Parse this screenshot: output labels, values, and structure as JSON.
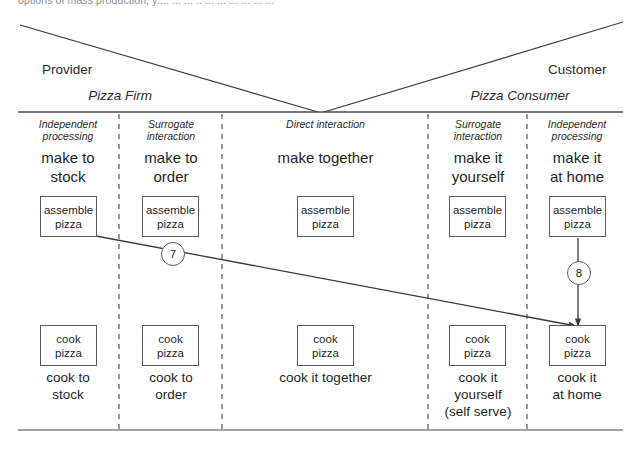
{
  "page": {
    "clipped_caption": "options of mass production, y.... ... ... .. ... ... ... ... ... ..."
  },
  "sides": {
    "provider": "Provider",
    "customer": "Customer"
  },
  "parties": {
    "left": "Pizza Firm",
    "right": "Pizza Consumer"
  },
  "columns": [
    {
      "mode_line1": "Independent",
      "mode_line2": "processing",
      "title_line1": "make to",
      "title_line2": "stock",
      "top_box_line1": "assemble",
      "top_box_line2": "pizza",
      "bottom_box_line1": "cook",
      "bottom_box_line2": "pizza",
      "bottom_label_line1": "cook to",
      "bottom_label_line2": "stock",
      "bottom_label_line3": ""
    },
    {
      "mode_line1": "Surrogate",
      "mode_line2": "interaction",
      "title_line1": "make to",
      "title_line2": "order",
      "top_box_line1": "assemble",
      "top_box_line2": "pizza",
      "bottom_box_line1": "cook",
      "bottom_box_line2": "pizza",
      "bottom_label_line1": "cook to",
      "bottom_label_line2": "order",
      "bottom_label_line3": ""
    },
    {
      "mode_line1": "Direct interaction",
      "mode_line2": "",
      "title_line1": "make together",
      "title_line2": "",
      "top_box_line1": "assemble",
      "top_box_line2": "pizza",
      "bottom_box_line1": "cook",
      "bottom_box_line2": "pizza",
      "bottom_label_line1": "cook it together",
      "bottom_label_line2": "",
      "bottom_label_line3": ""
    },
    {
      "mode_line1": "Surrogate",
      "mode_line2": "interaction",
      "title_line1": "make it",
      "title_line2": "yourself",
      "top_box_line1": "assemble",
      "top_box_line2": "pizza",
      "bottom_box_line1": "cook",
      "bottom_box_line2": "pizza",
      "bottom_label_line1": "cook it",
      "bottom_label_line2": "yourself",
      "bottom_label_line3": "(self serve)"
    },
    {
      "mode_line1": "Independent",
      "mode_line2": "processing",
      "title_line1": "make it",
      "title_line2": "at home",
      "top_box_line1": "assemble",
      "top_box_line2": "pizza",
      "bottom_box_line1": "cook",
      "bottom_box_line2": "pizza",
      "bottom_label_line1": "cook it",
      "bottom_label_line2": "at home",
      "bottom_label_line3": ""
    }
  ],
  "flow_badges": {
    "diagonal": "7",
    "vertical": "8"
  },
  "colors": {
    "line": "#5b5b5b",
    "text": "#1f1f1f",
    "muted": "#8d8d93"
  }
}
